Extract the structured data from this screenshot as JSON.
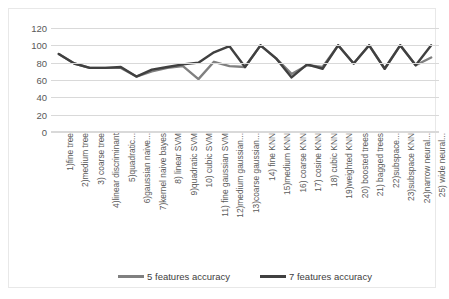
{
  "chart_data": {
    "type": "line",
    "title": "",
    "xlabel": "",
    "ylabel": "",
    "ylim": [
      0,
      120
    ],
    "ytick_values": [
      120,
      100,
      80,
      60,
      40,
      20,
      0
    ],
    "ytick_labels": [
      "120",
      "100",
      "80",
      "60",
      "40",
      "20",
      "0"
    ],
    "grid": true,
    "legend_position": "bottom",
    "categories": [
      "1)fine tree",
      "2)medium tree",
      "3) coarse tree",
      "4)linear discriminant",
      "5)quadratic...",
      "6)gaussian naive...",
      "7)kernel naive bayes",
      "8) linear SVM",
      "9)quadratic SVM",
      "10) cubic SVM",
      "11) fine gaussian SVM",
      "12)medium gaussian...",
      "13)coarse gaussian...",
      "14) fine KNN",
      "15)medium KNN",
      "16) coarse KNN",
      "17) cosine KNN",
      "18) cubic KNN",
      "19)weighted KNN",
      "20) boosted trees",
      "21) bagged trees",
      "22)subspace...",
      "23)subspace   KNN",
      "24)narrow neural...",
      "25) wide neural..."
    ],
    "series": [
      {
        "name": "5 features accuracy",
        "color": "#808080",
        "values": [
          90,
          79,
          74,
          74,
          74,
          64,
          70,
          74,
          76,
          61,
          81,
          76,
          75,
          100,
          85,
          67,
          77,
          75,
          100,
          79,
          100,
          73,
          100,
          77,
          86
        ]
      },
      {
        "name": "7 features accuracy",
        "color": "#404040",
        "values": [
          90,
          79,
          74,
          74,
          75,
          64,
          72,
          75,
          78,
          80,
          92,
          99,
          75,
          100,
          85,
          63,
          78,
          73,
          100,
          79,
          100,
          73,
          100,
          77,
          100
        ]
      }
    ]
  },
  "legend": {
    "entries": [
      {
        "label": "5 features accuracy",
        "color": "#808080"
      },
      {
        "label": "7 features accuracy",
        "color": "#404040"
      }
    ]
  }
}
